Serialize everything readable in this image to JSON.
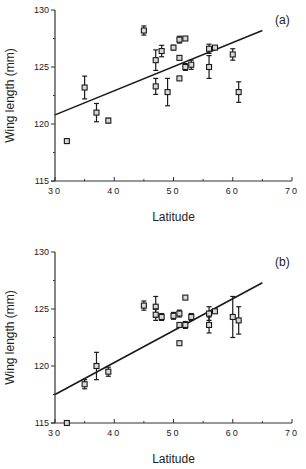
{
  "chart_data": [
    {
      "type": "scatter",
      "panel_label": "(a)",
      "title": "",
      "xlabel": "Latitude",
      "ylabel": "Wing length (mm)",
      "xlim": [
        30,
        70
      ],
      "ylim": [
        115,
        130
      ],
      "x_ticks": [
        30,
        40,
        50,
        60,
        70
      ],
      "x_tick_labels": [
        "30",
        "40",
        "50",
        "60",
        "70"
      ],
      "y_ticks": [
        115,
        120,
        125,
        130
      ],
      "y_tick_labels": [
        "115",
        "120",
        "125",
        "130"
      ],
      "grid": false,
      "legend": null,
      "marker": "open-square",
      "points": [
        {
          "x": 32,
          "y": 118.5,
          "err": 0.2
        },
        {
          "x": 35,
          "y": 123.2,
          "err": 1.0
        },
        {
          "x": 37,
          "y": 121.0,
          "err": 0.8
        },
        {
          "x": 39,
          "y": 120.3,
          "err": 0.2
        },
        {
          "x": 45,
          "y": 128.2,
          "err": 0.4
        },
        {
          "x": 47,
          "y": 125.6,
          "err": 0.9
        },
        {
          "x": 47,
          "y": 123.3,
          "err": 0.7
        },
        {
          "x": 48,
          "y": 126.4,
          "err": 0.5
        },
        {
          "x": 49,
          "y": 122.8,
          "err": 1.2
        },
        {
          "x": 50,
          "y": 126.7,
          "err": 0.2
        },
        {
          "x": 51,
          "y": 127.4,
          "err": 0.3
        },
        {
          "x": 51,
          "y": 125.8,
          "err": 0
        },
        {
          "x": 51,
          "y": 124.0,
          "err": 0
        },
        {
          "x": 52,
          "y": 127.5,
          "err": 0.1
        },
        {
          "x": 52,
          "y": 125.0,
          "err": 0.3
        },
        {
          "x": 53,
          "y": 125.2,
          "err": 0.4
        },
        {
          "x": 56,
          "y": 126.6,
          "err": 0.4
        },
        {
          "x": 56,
          "y": 125.0,
          "err": 1.0
        },
        {
          "x": 57,
          "y": 126.7,
          "err": 0
        },
        {
          "x": 60,
          "y": 126.1,
          "err": 0.5
        },
        {
          "x": 61,
          "y": 122.8,
          "err": 0.9
        }
      ],
      "regression_line": {
        "x": [
          30,
          65
        ],
        "y": [
          120.8,
          128.2
        ]
      }
    },
    {
      "type": "scatter",
      "panel_label": "(b)",
      "title": "",
      "xlabel": "Latitude",
      "ylabel": "Wing length (mm)",
      "xlim": [
        30,
        70
      ],
      "ylim": [
        115,
        130
      ],
      "x_ticks": [
        30,
        40,
        50,
        60,
        70
      ],
      "x_tick_labels": [
        "30",
        "40",
        "50",
        "60",
        "70"
      ],
      "y_ticks": [
        115,
        120,
        125,
        130
      ],
      "y_tick_labels": [
        "115",
        "120",
        "125",
        "130"
      ],
      "grid": false,
      "legend": null,
      "marker": "open-square",
      "points": [
        {
          "x": 32,
          "y": 115.0,
          "err": 0.2
        },
        {
          "x": 35,
          "y": 118.4,
          "err": 0.4
        },
        {
          "x": 37,
          "y": 120.0,
          "err": 1.2
        },
        {
          "x": 39,
          "y": 119.5,
          "err": 0.4
        },
        {
          "x": 45,
          "y": 125.3,
          "err": 0.4
        },
        {
          "x": 47,
          "y": 125.2,
          "err": 0.9
        },
        {
          "x": 47,
          "y": 124.5,
          "err": 0.5
        },
        {
          "x": 48,
          "y": 124.3,
          "err": 0.3
        },
        {
          "x": 50,
          "y": 124.4,
          "err": 0.3
        },
        {
          "x": 51,
          "y": 124.6,
          "err": 0.3
        },
        {
          "x": 51,
          "y": 123.6,
          "err": 0
        },
        {
          "x": 51,
          "y": 122.0,
          "err": 0
        },
        {
          "x": 52,
          "y": 126.0,
          "err": 0
        },
        {
          "x": 52,
          "y": 123.6,
          "err": 0.3
        },
        {
          "x": 53,
          "y": 124.3,
          "err": 0.3
        },
        {
          "x": 56,
          "y": 124.6,
          "err": 0.6
        },
        {
          "x": 56,
          "y": 123.6,
          "err": 0.7
        },
        {
          "x": 57,
          "y": 124.8,
          "err": 0
        },
        {
          "x": 60,
          "y": 124.3,
          "err": 1.8
        },
        {
          "x": 61,
          "y": 124.0,
          "err": 1.2
        }
      ],
      "regression_line": {
        "x": [
          30,
          65
        ],
        "y": [
          117.5,
          127.3
        ]
      }
    }
  ],
  "layout": {
    "panels": [
      {
        "plot_left": 55,
        "plot_right": 292,
        "plot_top": 10,
        "plot_bottom": 181,
        "label_x": 275,
        "label_y": 24,
        "xlabel_y": 221,
        "ylabel_x": 14
      },
      {
        "plot_left": 55,
        "plot_right": 292,
        "plot_top": 252,
        "plot_bottom": 423,
        "label_x": 275,
        "label_y": 266,
        "xlabel_y": 463,
        "ylabel_x": 14
      }
    ],
    "colors": {
      "ink": "#1a1a1a",
      "axis": "#333333",
      "marker_fill": "#d8d8d8"
    }
  }
}
